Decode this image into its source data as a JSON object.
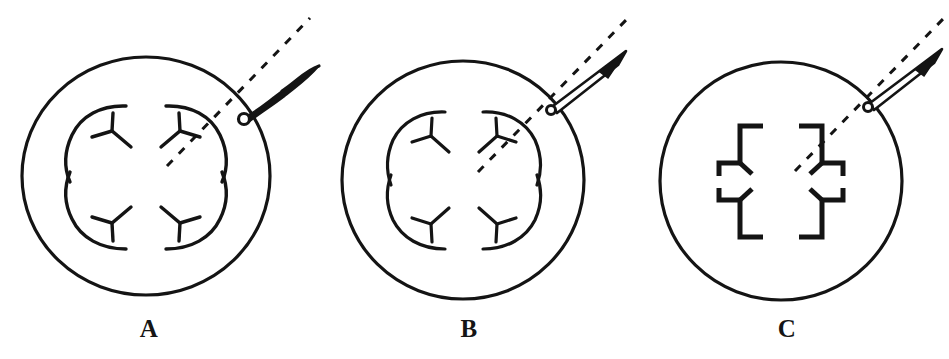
{
  "figure": {
    "domain": "Diagram",
    "caption_letters": [
      "A",
      "B",
      "C"
    ],
    "background_color": "#ffffff",
    "ink_color": "#141414",
    "canvas": {
      "width": 949,
      "height": 359
    },
    "panels": [
      {
        "id": "A",
        "label": "A",
        "label_position": {
          "x": 119,
          "y": 316
        },
        "outline": {
          "shape": "circle",
          "center": {
            "x": 146,
            "y": 176
          },
          "radius_x": 124,
          "radius_y": 119,
          "stroke_width": 3.2
        },
        "inner_structure": {
          "type": "rosette",
          "style": "curved-arcs",
          "lobes": 4,
          "description": "four curved Y-forked arcs forming a quatrefoil",
          "lobe_radius": 46,
          "lobe_offset": 40
        },
        "attachment": {
          "type": "curved-wavy-stalk",
          "node": {
            "x": 244,
            "y": 112
          },
          "tip": {
            "x": 318,
            "y": 66
          },
          "node_radius": 5
        },
        "axis_line": {
          "type": "dashed",
          "from": {
            "x": 167,
            "y": 166
          },
          "to": {
            "x": 310,
            "y": 18
          },
          "dash": "8 9",
          "stroke_width": 3
        }
      },
      {
        "id": "B",
        "label": "B",
        "label_position": {
          "x": 439,
          "y": 316
        },
        "outline": {
          "shape": "circle",
          "center": {
            "x": 463,
            "y": 180
          },
          "radius_x": 121,
          "radius_y": 119,
          "stroke_width": 3.2
        },
        "inner_structure": {
          "type": "rosette",
          "style": "curved-arcs",
          "lobes": 4,
          "description": "four curved Y-forked arcs forming a quatrefoil",
          "lobe_radius": 44,
          "lobe_offset": 38
        },
        "attachment": {
          "type": "straight-tapered-stalk",
          "node": {
            "x": 552,
            "y": 101
          },
          "tip": {
            "x": 625,
            "y": 52
          },
          "node_radius": 4
        },
        "axis_line": {
          "type": "dashed",
          "from": {
            "x": 478,
            "y": 172
          },
          "to": {
            "x": 628,
            "y": 18
          },
          "dash": "8 9",
          "stroke_width": 3
        }
      },
      {
        "id": "C",
        "label": "C",
        "label_position": {
          "x": 757,
          "y": 316
        },
        "outline": {
          "shape": "circle",
          "center": {
            "x": 781,
            "y": 181
          },
          "radius_x": 121,
          "radius_y": 119,
          "stroke_width": 3.2
        },
        "inner_structure": {
          "type": "cross",
          "style": "angular-brackets",
          "lobes": 4,
          "description": "four angular L-bracket quadrants with short forks forming a plus/cross",
          "bracket_outer": 62,
          "bracket_inner": 18,
          "stroke_width": 5
        },
        "attachment": {
          "type": "straight-tapered-stalk",
          "node": {
            "x": 869,
            "y": 98
          },
          "tip": {
            "x": 941,
            "y": 50
          },
          "node_radius": 4
        },
        "axis_line": {
          "type": "dashed",
          "from": {
            "x": 795,
            "y": 171
          },
          "to": {
            "x": 944,
            "y": 18
          },
          "dash": "8 9",
          "stroke_width": 3
        }
      }
    ]
  }
}
